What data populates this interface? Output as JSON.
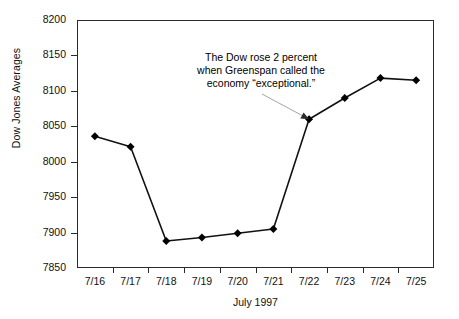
{
  "chart_data": {
    "type": "line",
    "title": "",
    "xlabel": "July 1997",
    "ylabel": "Dow Jones Averages",
    "categories": [
      "7/16",
      "7/17",
      "7/18",
      "7/19",
      "7/20",
      "7/21",
      "7/22",
      "7/23",
      "7/24",
      "7/25"
    ],
    "values": [
      8036,
      8021,
      7888,
      7893,
      7899,
      7905,
      8060,
      8090,
      8118,
      8115
    ],
    "series": [
      {
        "name": "Dow Jones Averages",
        "values": [
          8036,
          8021,
          7888,
          7893,
          7899,
          7905,
          8060,
          8090,
          8118,
          8115
        ],
        "marker": "diamond",
        "color": "#000000"
      }
    ],
    "ylim": [
      7850,
      8200
    ],
    "yticks": [
      7850,
      7900,
      7950,
      8000,
      8050,
      8100,
      8150,
      8200
    ],
    "ytick_labels": [
      "7850",
      "7900",
      "7950",
      "8000",
      "8050",
      "8100",
      "8150",
      "8200"
    ],
    "grid": false,
    "legend": false,
    "legend_position": "none",
    "annotations": [
      {
        "text": "The Dow rose 2 percent when Greenspan called the economy “exceptional.”",
        "lines": [
          "The Dow rose 2 percent",
          "when Greenspan called the",
          "economy “exceptional.”"
        ],
        "points_to_category": "7/22",
        "points_to_value": 8060
      }
    ]
  },
  "axes": {
    "y_title": "Dow Jones Averages",
    "x_title": "July 1997"
  },
  "colors": {
    "line": "#111111",
    "marker": "#000000",
    "frame": "#2a2a2a",
    "leader": "#9a9a9a",
    "background": "#ffffff"
  }
}
